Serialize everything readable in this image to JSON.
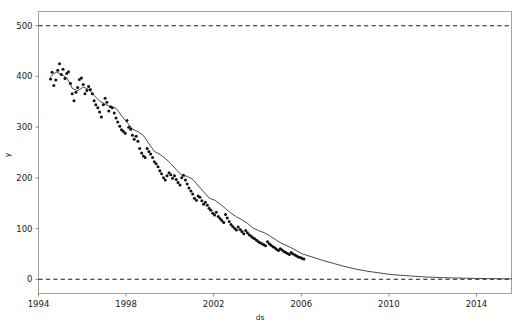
{
  "figure": {
    "title": "",
    "background_color": "#ffffff",
    "width": 522,
    "height": 328
  },
  "axis": {
    "x_label": "ds",
    "y_label": "y",
    "x_ticks": [
      "1994",
      "1998",
      "2002",
      "2006",
      "2010",
      "2014"
    ],
    "y_ticks": [
      "0",
      "100",
      "200",
      "300",
      "400",
      "500"
    ]
  },
  "colors": {
    "observation_points": "#111111",
    "fitted_line": "#2b2b2b",
    "cap_floor_line": "#1a1a1a",
    "frame": "#9a9a9a",
    "text": "#1a1a1a"
  },
  "chart_data": {
    "type": "scatter",
    "title": "",
    "xlabel": "ds",
    "ylabel": "y",
    "xlim": [
      1994.0,
      2015.6
    ],
    "ylim": [
      -28,
      528
    ],
    "grid": false,
    "legend": null,
    "x_ticks": [
      1994,
      1998,
      2002,
      2006,
      2010,
      2014
    ],
    "y_ticks": [
      0,
      100,
      200,
      300,
      400,
      500
    ],
    "series": [
      {
        "name": "cap",
        "type": "line",
        "style": "dashed",
        "constant_value": 500,
        "x": [
          1994.0,
          2015.6
        ],
        "values": [
          500,
          500
        ]
      },
      {
        "name": "floor",
        "type": "line",
        "style": "dashed",
        "constant_value": 0,
        "x": [
          1994.0,
          2015.6
        ],
        "values": [
          0,
          0
        ]
      },
      {
        "name": "yhat",
        "type": "line",
        "style": "solid",
        "x": [
          1994.55,
          1994.8,
          1995.05,
          1995.3,
          1995.55,
          1995.8,
          1996.05,
          1996.3,
          1996.55,
          1996.8,
          1997.05,
          1997.3,
          1997.55,
          1997.8,
          1998.05,
          1998.3,
          1998.55,
          1998.8,
          1999.05,
          1999.3,
          1999.55,
          1999.8,
          2000.05,
          2000.3,
          2000.55,
          2000.8,
          2001.05,
          2001.3,
          2001.55,
          2001.8,
          2002.05,
          2002.3,
          2002.55,
          2002.8,
          2003.05,
          2003.3,
          2003.55,
          2003.8,
          2004.05,
          2004.3,
          2004.55,
          2004.8,
          2005.05,
          2005.3,
          2005.55,
          2005.8,
          2006.05,
          2006.5,
          2007.0,
          2007.5,
          2008.0,
          2008.5,
          2009.0,
          2009.5,
          2010.0,
          2010.5,
          2011.0,
          2011.5,
          2012.0,
          2012.5,
          2013.0,
          2013.5,
          2014.0,
          2014.5,
          2015.0,
          2015.6
        ],
        "values": [
          399,
          409,
          404,
          397,
          376,
          372,
          379,
          374,
          362,
          351,
          345,
          340,
          337,
          322,
          309,
          296,
          291,
          283,
          267,
          252,
          246,
          238,
          228,
          216,
          205,
          203,
          197,
          184,
          172,
          160,
          156,
          148,
          139,
          130,
          123,
          117,
          110,
          101,
          96,
          92,
          86,
          79,
          72,
          67,
          62,
          56,
          50,
          44,
          37,
          31,
          25,
          20,
          16,
          13,
          10,
          8,
          6.5,
          5,
          4,
          3.2,
          2.6,
          2.1,
          1.7,
          1.4,
          1.1,
          0.9
        ]
      },
      {
        "name": "y_observed",
        "type": "scatter",
        "x": [
          1994.55,
          1994.62,
          1994.7,
          1994.79,
          1994.88,
          1994.96,
          1995.04,
          1995.12,
          1995.21,
          1995.29,
          1995.37,
          1995.46,
          1995.54,
          1995.62,
          1995.71,
          1995.79,
          1995.87,
          1995.96,
          1996.04,
          1996.12,
          1996.21,
          1996.29,
          1996.37,
          1996.46,
          1996.54,
          1996.62,
          1996.71,
          1996.79,
          1996.87,
          1996.96,
          1997.04,
          1997.12,
          1997.21,
          1997.29,
          1997.37,
          1997.46,
          1997.54,
          1997.62,
          1997.71,
          1997.79,
          1997.87,
          1997.96,
          1998.04,
          1998.12,
          1998.21,
          1998.29,
          1998.37,
          1998.46,
          1998.54,
          1998.62,
          1998.71,
          1998.79,
          1998.87,
          1998.96,
          1999.04,
          1999.12,
          1999.21,
          1999.29,
          1999.37,
          1999.46,
          1999.54,
          1999.62,
          1999.71,
          1999.79,
          1999.87,
          1999.96,
          2000.04,
          2000.12,
          2000.21,
          2000.29,
          2000.37,
          2000.46,
          2000.54,
          2000.62,
          2000.71,
          2000.79,
          2000.87,
          2000.96,
          2001.04,
          2001.12,
          2001.21,
          2001.29,
          2001.37,
          2001.46,
          2001.54,
          2001.62,
          2001.71,
          2001.79,
          2001.87,
          2001.96,
          2002.04,
          2002.12,
          2002.21,
          2002.29,
          2002.37,
          2002.46,
          2002.54,
          2002.62,
          2002.71,
          2002.79,
          2002.87,
          2002.96,
          2003.04,
          2003.12,
          2003.21,
          2003.29,
          2003.37,
          2003.46,
          2003.54,
          2003.62,
          2003.71,
          2003.79,
          2003.87,
          2003.96,
          2004.04,
          2004.12,
          2004.21,
          2004.29,
          2004.37,
          2004.46,
          2004.54,
          2004.62,
          2004.71,
          2004.79,
          2004.87,
          2004.96,
          2005.04,
          2005.12,
          2005.21,
          2005.29,
          2005.37,
          2005.46,
          2005.54,
          2005.62,
          2005.71,
          2005.79,
          2005.87,
          2005.96,
          2006.04,
          2006.12
        ],
        "values": [
          395,
          408,
          382,
          393,
          412,
          425,
          404,
          414,
          396,
          406,
          409,
          386,
          366,
          352,
          369,
          378,
          394,
          397,
          384,
          366,
          372,
          380,
          374,
          366,
          352,
          344,
          338,
          330,
          320,
          344,
          357,
          349,
          332,
          340,
          338,
          328,
          318,
          310,
          302,
          295,
          292,
          288,
          313,
          300,
          296,
          284,
          276,
          282,
          272,
          258,
          249,
          243,
          240,
          258,
          252,
          247,
          240,
          232,
          228,
          222,
          214,
          208,
          200,
          196,
          204,
          210,
          206,
          199,
          204,
          197,
          191,
          186,
          200,
          205,
          196,
          188,
          180,
          174,
          168,
          160,
          156,
          164,
          162,
          155,
          148,
          152,
          146,
          140,
          136,
          130,
          127,
          132,
          124,
          120,
          116,
          112,
          128,
          121,
          114,
          108,
          104,
          100,
          97,
          103,
          98,
          94,
          90,
          96,
          92,
          88,
          85,
          82,
          80,
          77,
          74,
          72,
          70,
          68,
          66,
          74,
          70,
          67,
          64,
          62,
          59,
          57,
          60,
          58,
          55,
          53,
          51,
          49,
          53,
          50,
          48,
          46,
          44,
          43,
          41,
          40
        ]
      }
    ]
  }
}
